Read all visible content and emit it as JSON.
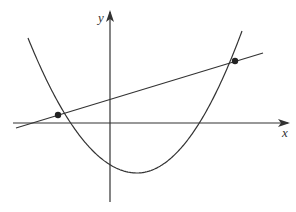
{
  "diagram": {
    "axes": {
      "x_label": "x",
      "y_label": "y",
      "origin": [
        110,
        123
      ],
      "x_axis": {
        "start": [
          13,
          123
        ],
        "end": [
          288,
          123
        ]
      },
      "y_axis": {
        "start": [
          110,
          202
        ],
        "end": [
          110,
          12
        ]
      }
    },
    "parabola": {
      "vertex": [
        137,
        173
      ],
      "left_top": [
        28,
        38
      ],
      "right_top": [
        242,
        31
      ],
      "x_intercept_right": [
        208,
        123
      ]
    },
    "line": {
      "start": [
        16,
        128
      ],
      "end": [
        263,
        53
      ]
    },
    "intersection_points": [
      {
        "x": 58,
        "y": 115
      },
      {
        "x": 235,
        "y": 61
      }
    ],
    "colors": {
      "stroke": "#333333",
      "background": "#ffffff"
    }
  }
}
